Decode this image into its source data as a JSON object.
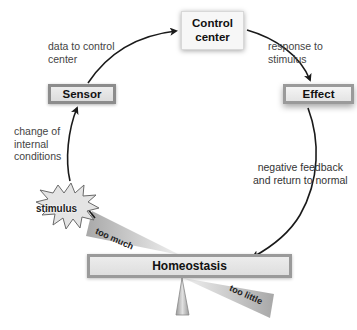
{
  "diagram": {
    "boxes": {
      "control_center": "Control center",
      "sensor": "Sensor",
      "effect": "Effect",
      "homeostasis": "Homeostasis"
    },
    "labels": {
      "data_to_control": [
        "data to control",
        "center"
      ],
      "response": [
        "response to",
        "stimulus"
      ],
      "change": [
        "change of",
        "internal",
        "conditions"
      ],
      "negative_feedback": [
        "negative feedback",
        "and return to normal"
      ]
    },
    "stimulus": "stimulus",
    "balance": {
      "too_much": "too much",
      "too_little": "too little"
    },
    "colors": {
      "arrow": "#1a1a1a",
      "box_border": "#8c8c8c",
      "box_fill": "#e6e6e6",
      "wedge": "#c8c8c8"
    }
  }
}
